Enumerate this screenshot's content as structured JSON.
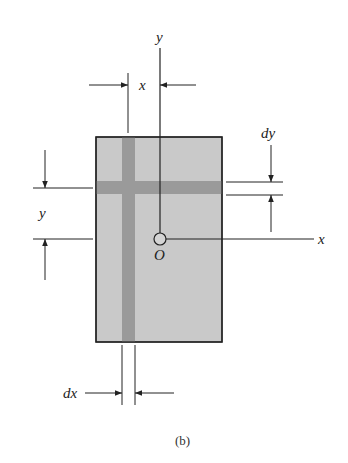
{
  "figure": {
    "caption": "(b)",
    "colors": {
      "area_fill": "#c9c9c9",
      "strip_fill": "#9a9a9a",
      "line": "#222222",
      "background": "#ffffff"
    }
  },
  "labels": {
    "y_axis": "y",
    "x_axis": "x",
    "origin": "O",
    "x_distance": "x",
    "y_distance": "y",
    "dy": "dy",
    "dx": "dx"
  }
}
